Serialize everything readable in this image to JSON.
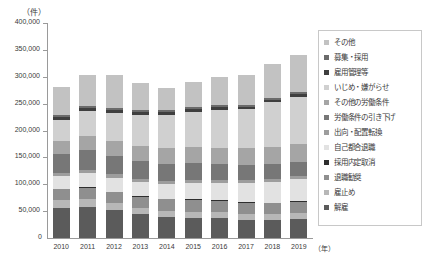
{
  "chart_data": {
    "type": "bar",
    "stacked": true,
    "title": "",
    "subtitle": "",
    "unit_label": "（件）",
    "xlabel": "（年）",
    "ylabel": "",
    "ylim": [
      0,
      400000
    ],
    "ytick_step": 50000,
    "grid": false,
    "legend_position": "right",
    "categories": [
      "2010",
      "2011",
      "2012",
      "2013",
      "2014",
      "2015",
      "2016",
      "2017",
      "2018",
      "2019"
    ],
    "ytick_labels": [
      "400,000",
      "350,000",
      "300,000",
      "250,000",
      "200,000",
      "150,000",
      "100,000",
      "50,000"
    ],
    "ytick_values": [
      400000,
      350000,
      300000,
      250000,
      200000,
      150000,
      100000,
      50000
    ],
    "origin_label": "0",
    "series": [
      {
        "name": "解雇",
        "color": "#5b5b5b",
        "values": [
          55500,
          57800,
          51500,
          43900,
          38500,
          37800,
          36800,
          33300,
          32600,
          34600
        ]
      },
      {
        "name": "雇止め",
        "color": "#b7b7b7",
        "values": [
          14800,
          14200,
          13000,
          12100,
          11800,
          11400,
          11200,
          11000,
          11300,
          11700
        ]
      },
      {
        "name": "退職勧奨",
        "color": "#8f8f8f",
        "values": [
          20200,
          21300,
          20500,
          20400,
          21400,
          21900,
          21100,
          21400,
          21100,
          21300
        ]
      },
      {
        "name": "採用内定取消",
        "color": "#2e2e2e",
        "values": [
          1600,
          1500,
          1300,
          1200,
          1100,
          1100,
          1000,
          1000,
          1000,
          1000
        ]
      },
      {
        "name": "自己都合退職",
        "color": "#e2e2e2",
        "values": [
          23500,
          25300,
          26100,
          26600,
          28500,
          31100,
          33000,
          35500,
          38900,
          41300
        ]
      },
      {
        "name": "出向・配置転換",
        "color": "#9d9d9d",
        "values": [
          5900,
          6100,
          5900,
          5700,
          5600,
          5500,
          5300,
          5300,
          5200,
          5300
        ]
      },
      {
        "name": "労働条件の引き下げ",
        "color": "#777777",
        "values": [
          35000,
          37200,
          35100,
          32700,
          31000,
          30300,
          29600,
          28900,
          27700,
          27200
        ]
      },
      {
        "name": "その他の労働条件",
        "color": "#a5a5a5",
        "values": [
          24400,
          26700,
          27900,
          27800,
          29100,
          29600,
          30100,
          31400,
          32100,
          33400
        ]
      },
      {
        "name": "いじめ・嫌がらせ",
        "color": "#d0d0d0",
        "values": [
          39400,
          45900,
          51700,
          59200,
          62200,
          66600,
          70900,
          72000,
          82800,
          87500
        ]
      },
      {
        "name": "雇用管理等",
        "color": "#3f3f3f",
        "values": [
          5200,
          5600,
          5400,
          5200,
          5000,
          4800,
          4700,
          4600,
          4600,
          4700
        ]
      },
      {
        "name": "募集・採用",
        "color": "#6b6b6b",
        "values": [
          4000,
          4200,
          4100,
          3900,
          3800,
          3700,
          3600,
          3600,
          3600,
          3700
        ]
      },
      {
        "name": "その他",
        "color": "#c2c2c2",
        "values": [
          51500,
          57200,
          60500,
          49300,
          42000,
          46200,
          51700,
          56000,
          62100,
          69300
        ]
      }
    ],
    "totals": [
      281000,
      303000,
      303000,
      288000,
      280000,
      290000,
      299000,
      304000,
      323000,
      341000
    ]
  },
  "legend": {
    "items": [
      {
        "label": "その他",
        "color": "#c2c2c2"
      },
      {
        "label": "募集・採用",
        "color": "#6b6b6b"
      },
      {
        "label": "雇用管理等",
        "color": "#3f3f3f"
      },
      {
        "label": "いじめ・嫌がらせ",
        "color": "#d0d0d0"
      },
      {
        "label": "その他の労働条件",
        "color": "#a5a5a5"
      },
      {
        "label": "労働条件の引き下げ",
        "color": "#777777"
      },
      {
        "label": "出向・配置転換",
        "color": "#9d9d9d"
      },
      {
        "label": "自己都合退職",
        "color": "#e2e2e2"
      },
      {
        "label": "採用内定取消",
        "color": "#2e2e2e"
      },
      {
        "label": "退職勧奨",
        "color": "#8f8f8f"
      },
      {
        "label": "雇止め",
        "color": "#b7b7b7"
      },
      {
        "label": "解雇",
        "color": "#5b5b5b"
      }
    ]
  }
}
